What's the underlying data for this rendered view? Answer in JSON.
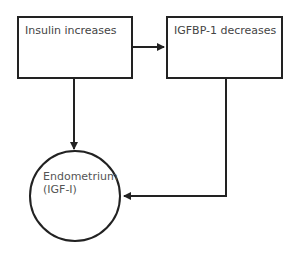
{
  "diagram": {
    "nodes": [
      {
        "id": "insulin",
        "shape": "rectangle",
        "label": "Insulin increases"
      },
      {
        "id": "igfbp1",
        "shape": "rectangle",
        "label": "IGFBP-1 decreases"
      },
      {
        "id": "endometrium",
        "shape": "circle",
        "label_line1": "Endometrium",
        "label_line2": "(IGF-I)"
      }
    ],
    "edges": [
      {
        "from": "insulin",
        "to": "igfbp1"
      },
      {
        "from": "insulin",
        "to": "endometrium"
      },
      {
        "from": "igfbp1",
        "to": "endometrium"
      }
    ],
    "colors": {
      "stroke": "#222222",
      "text": "#444444",
      "background": "#ffffff"
    }
  }
}
